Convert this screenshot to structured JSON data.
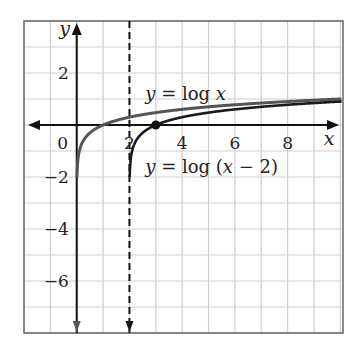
{
  "chart_data": {
    "type": "line",
    "title": "",
    "xlabel": "x",
    "ylabel": "y",
    "xlim": [
      -2,
      10.1
    ],
    "ylim": [
      -8,
      4
    ],
    "grid": true,
    "x_ticks": [
      0,
      2,
      4,
      6,
      8
    ],
    "y_ticks": [
      2,
      -2,
      -4,
      -6
    ],
    "x_tick_labels": [
      "0",
      "2",
      "4",
      "6",
      "8"
    ],
    "y_tick_labels": [
      "2",
      "−2",
      "−4",
      "−6"
    ],
    "series": [
      {
        "name": "y = log x",
        "expr": "log10(x)",
        "domain": [
          0.01,
          10.1
        ],
        "color": "#555555"
      },
      {
        "name": "y = log (x − 2)",
        "expr": "log10(x-2)",
        "domain": [
          2.01,
          10.1
        ],
        "color": "#1a1a1a"
      }
    ],
    "asymptote": {
      "x": 2,
      "style": "dashed"
    },
    "points": [
      {
        "x": 3,
        "y": 0,
        "label": ""
      }
    ],
    "annotations": [
      {
        "text_pre": "y",
        "text_post": " = log ",
        "text_var": "x",
        "text_tail": "",
        "x": 2.6,
        "y": 1.2
      },
      {
        "text_pre": "y",
        "text_post": " = log (",
        "text_var": "x",
        "text_tail": " − 2)",
        "x": 2.6,
        "y": -1.6
      }
    ]
  },
  "labels": {
    "x_axis": "x",
    "y_axis": "y",
    "curve1": "y = log x",
    "curve2": "y = log (x − 2)"
  }
}
